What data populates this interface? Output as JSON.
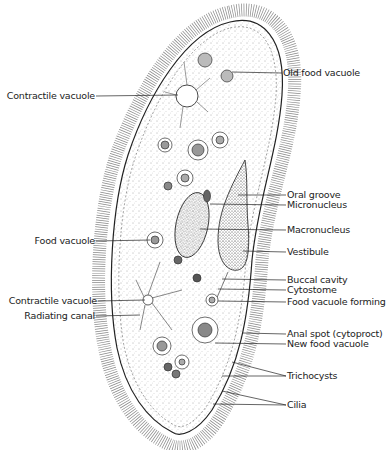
{
  "diagram": {
    "labels_right": [
      {
        "id": "old-food-vacuole",
        "text": "Old food vacuole",
        "x": 283,
        "y": 68,
        "tx": 232,
        "ty": 72
      },
      {
        "id": "oral-groove",
        "text": "Oral groove",
        "x": 287,
        "y": 190,
        "tx": 238,
        "ty": 195
      },
      {
        "id": "micronucleus",
        "text": "Micronucleus",
        "x": 287,
        "y": 200,
        "tx": 210,
        "ty": 204
      },
      {
        "id": "macronucleus",
        "text": "Macronucleus",
        "x": 287,
        "y": 225,
        "tx": 200,
        "ty": 229
      },
      {
        "id": "vestibule",
        "text": "Vestibule",
        "x": 287,
        "y": 247,
        "tx": 243,
        "ty": 251
      },
      {
        "id": "buccal-cavity",
        "text": "Buccal cavity",
        "x": 287,
        "y": 275,
        "tx": 222,
        "ty": 279
      },
      {
        "id": "cytostome",
        "text": "Cytostome",
        "x": 287,
        "y": 285,
        "tx": 218,
        "ty": 289
      },
      {
        "id": "food-vacuole-forming",
        "text": "Food vacuole forming",
        "x": 287,
        "y": 297,
        "tx": 218,
        "ty": 301
      },
      {
        "id": "anal-spot",
        "text": "Anal spot (cytoproct)",
        "x": 287,
        "y": 329,
        "tx": 243,
        "ty": 333
      },
      {
        "id": "new-food-vacuole",
        "text": "New food vacuole",
        "x": 287,
        "y": 339,
        "tx": 215,
        "ty": 343
      },
      {
        "id": "trichocysts",
        "text": "Trichocysts",
        "x": 287,
        "y": 371,
        "tx": 232,
        "ty": 362,
        "tx2": 222,
        "ty2": 376
      },
      {
        "id": "cilia",
        "text": "Cilia",
        "x": 287,
        "y": 400,
        "tx": 222,
        "ty": 391,
        "tx2": 213,
        "ty2": 404
      }
    ],
    "labels_left": [
      {
        "id": "contractile-vacuole-top",
        "text": "Contractile vacuole",
        "x": 95,
        "y": 91,
        "tx": 178,
        "ty": 95
      },
      {
        "id": "food-vacuole",
        "text": "Food vacuole",
        "x": 95,
        "y": 236,
        "tx": 150,
        "ty": 240
      },
      {
        "id": "contractile-vacuole-bottom",
        "text": "Contractile vacuole",
        "x": 97,
        "y": 296,
        "tx": 145,
        "ty": 300
      },
      {
        "id": "radiating-canal",
        "text": "Radiating canal",
        "x": 95,
        "y": 311,
        "tx": 140,
        "ty": 315
      }
    ]
  }
}
